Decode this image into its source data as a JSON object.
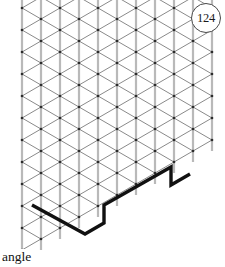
{
  "figure": {
    "badge_number": "124",
    "caption_text": "angle",
    "grid": {
      "type": "triangular-isometric-dot-grid",
      "vertical_line_color": "#b9b9b9",
      "diagonal_line_color": "#8a8a8a",
      "dot_color": "#2b2b2b",
      "spacing_x": 19,
      "spacing_y": 11,
      "columns": 10,
      "rows": 12,
      "region_shape": "parallelogram-sheared-right"
    },
    "path": {
      "stroke_color": "#111111",
      "stroke_width": 3.4,
      "description": "bold polyline drawn along grid edges forming a stepped V shape",
      "points": [
        [
          32,
          205
        ],
        [
          85,
          234
        ],
        [
          104,
          223
        ],
        [
          104,
          205
        ],
        [
          171,
          167
        ],
        [
          171,
          185
        ],
        [
          190,
          174
        ]
      ]
    }
  }
}
